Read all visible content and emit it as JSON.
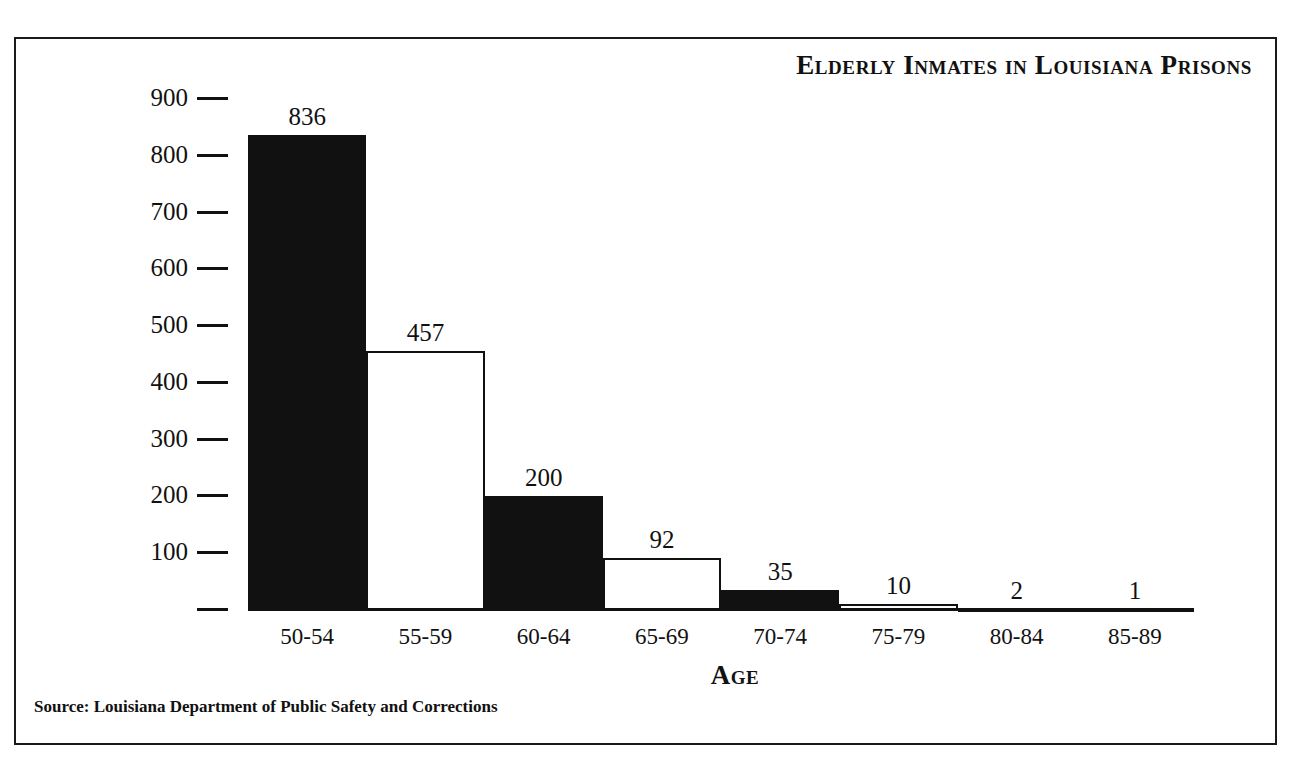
{
  "figure": {
    "title": "Elderly Inmates in Louisiana Prisons",
    "source_note": "Source: Louisiana Department of Public Safety and Corrections",
    "x_axis_title": "Age",
    "frame_color": "#1a1a1a",
    "ink_color": "#111111",
    "background": "#ffffff"
  },
  "chart_data": {
    "type": "bar",
    "title": "Elderly Inmates in Louisiana Prisons",
    "xlabel": "Age",
    "ylabel": "",
    "categories": [
      "50-54",
      "55-59",
      "60-64",
      "65-69",
      "70-74",
      "75-79",
      "80-84",
      "85-89"
    ],
    "values": [
      836,
      457,
      200,
      92,
      35,
      10,
      2,
      1
    ],
    "bar_fills": [
      "solid-black",
      "white",
      "solid-black",
      "white",
      "solid-black",
      "white",
      "solid-black",
      "white"
    ],
    "data_labels": [
      "836",
      "457",
      "200",
      "92",
      "35",
      "10",
      "2",
      "1"
    ],
    "ylim": [
      0,
      900
    ],
    "yticks": [
      0,
      100,
      200,
      300,
      400,
      500,
      600,
      700,
      800,
      900
    ],
    "ytick_labels": [
      "",
      "100",
      "200",
      "300",
      "400",
      "500",
      "600",
      "700",
      "800",
      "900"
    ],
    "grid": false,
    "legend": false,
    "source": "Louisiana Department of Public Safety and Corrections"
  }
}
